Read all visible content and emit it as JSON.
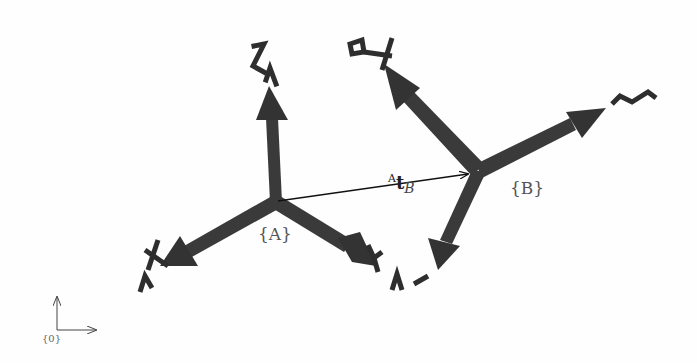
{
  "diagram": {
    "type": "coordinate-frames",
    "colors": {
      "axis_fill": "#3a3a3a",
      "axis_shade": "#2a2a2a",
      "vector_line": "#111111",
      "label_text": "#555555",
      "background": "#fefefe"
    },
    "frames": [
      {
        "id": "A",
        "label": "{A}",
        "label_var": "A",
        "origin": [
          276,
          202
        ],
        "axes": [
          {
            "name": "Z",
            "frame_tag": "A",
            "tip": [
              268,
              88
            ]
          },
          {
            "name": "X",
            "frame_tag": "A",
            "tip": [
              162,
              264
            ]
          },
          {
            "name": "Y",
            "frame_tag": "A",
            "tip": [
              374,
              262
            ]
          }
        ]
      },
      {
        "id": "B",
        "label": "{B}",
        "label_var": "B",
        "origin": [
          478,
          170
        ],
        "axes": [
          {
            "name": "X",
            "frame_tag": "B",
            "tip": [
              385,
              62
            ]
          },
          {
            "name": "Z",
            "frame_tag": "B",
            "tip": [
              606,
              108
            ]
          },
          {
            "name": "Y",
            "frame_tag": "B",
            "tip": [
              436,
              268
            ]
          }
        ]
      },
      {
        "id": "0",
        "label": "{0}",
        "origin": [
          57,
          330
        ],
        "axes": [
          {
            "name": "up",
            "tip": [
              57,
              296
            ]
          },
          {
            "name": "right",
            "tip": [
              96,
              330
            ]
          }
        ]
      }
    ],
    "vector": {
      "from": "A",
      "to": "B",
      "superscript": "A",
      "symbol": "t",
      "subscript": "B"
    }
  }
}
